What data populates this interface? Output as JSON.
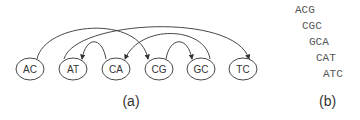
{
  "panel_a": {
    "caption": "(a)",
    "nodes": [
      {
        "id": "AC",
        "label": "AC",
        "x": 30,
        "y": 69
      },
      {
        "id": "AT",
        "label": "AT",
        "x": 73,
        "y": 69
      },
      {
        "id": "CA",
        "label": "CA",
        "x": 116,
        "y": 69
      },
      {
        "id": "CG",
        "label": "CG",
        "x": 159,
        "y": 69
      },
      {
        "id": "GC",
        "label": "GC",
        "x": 201,
        "y": 69
      },
      {
        "id": "TC",
        "label": "TC",
        "x": 243,
        "y": 69
      }
    ],
    "edges": [
      {
        "from": "AC",
        "to": "CG"
      },
      {
        "from": "AT",
        "to": "TC"
      },
      {
        "from": "CA",
        "to": "AT"
      },
      {
        "from": "CG",
        "to": "GC"
      },
      {
        "from": "GC",
        "to": "CA"
      }
    ]
  },
  "panel_b": {
    "caption": "(b)",
    "sequences": [
      "ACG",
      "CGC",
      "GCA",
      "CAT",
      "ATC"
    ]
  }
}
